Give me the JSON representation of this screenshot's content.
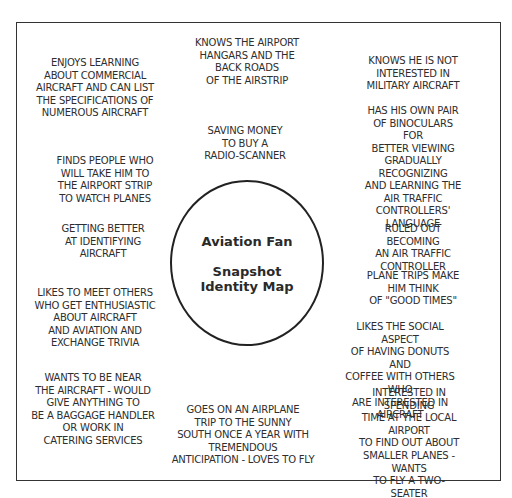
{
  "center": {
    "title": "Aviation Fan",
    "subtitle": "Snapshot\nIdentity Map"
  },
  "notes": [
    {
      "id": "commercial",
      "text": "ENJOYS LEARNING\nABOUT  COMMERCIAL\nAIRCRAFT AND CAN LIST\nTHE  SPECIFICATIONS OF\nNUMEROUS AIRCRAFT"
    },
    {
      "id": "hangars",
      "text": "KNOWS THE AIRPORT\nHANGARS AND THE\nBACK ROADS\nOF THE AIRSTRIP"
    },
    {
      "id": "military",
      "text": "KNOWS HE IS NOT\nINTERESTED IN\nMILITARY AIRCRAFT"
    },
    {
      "id": "binoculars",
      "text": "HAS HIS OWN PAIR\nOF BINOCULARS FOR\nBETTER VIEWING"
    },
    {
      "id": "scanner",
      "text": "SAVING MONEY\nTO BUY A\nRADIO-SCANNER"
    },
    {
      "id": "strip",
      "text": "FINDS PEOPLE WHO\nWILL TAKE HIM TO\nTHE AIRPORT STRIP\nTO WATCH PLANES"
    },
    {
      "id": "language",
      "text": "GRADUALLY RECOGNIZING\nAND LEARNING THE\nAIR TRAFFIC\nCONTROLLERS' LANGUAGE"
    },
    {
      "id": "identifying",
      "text": "GETTING BETTER\nAT IDENTIFYING\nAIRCRAFT"
    },
    {
      "id": "ruled-out",
      "text": "RULED OUT BECOMING\nAN AIR TRAFFIC\nCONTROLLER"
    },
    {
      "id": "good-times",
      "text": "PLANE TRIPS MAKE\nHIM THINK\nOF \"GOOD TIMES\""
    },
    {
      "id": "trivia",
      "text": "LIKES TO MEET OTHERS\nWHO GET ENTHUSIASTIC\nABOUT AIRCRAFT\nAND AVIATION AND\nEXCHANGE TRIVIA"
    },
    {
      "id": "social",
      "text": "LIKES THE SOCIAL ASPECT\nOF HAVING DONUTS AND\nCOFFEE WITH OTHERS WHO\nARE INTERESTED IN AIRCRAFT"
    },
    {
      "id": "baggage",
      "text": "WANTS TO BE NEAR\nTHE AIRCRAFT - WOULD\nGIVE ANYTHING TO\nBE A BAGGAGE HANDLER\nOR WORK IN\nCATERING SERVICES"
    },
    {
      "id": "trip-south",
      "text": "GOES ON AN AIRPLANE\nTRIP TO THE SUNNY\nSOUTH ONCE A YEAR WITH\nTREMENDOUS\nANTICIPATION - LOVES TO FLY"
    },
    {
      "id": "local-airport",
      "text": "INTERESTED IN SPENDING\nTIME AT THE LOCAL AIRPORT\nTO FIND OUT ABOUT\nSMALLER PLANES - WANTS\nTO FLY A TWO-SEATER"
    }
  ]
}
